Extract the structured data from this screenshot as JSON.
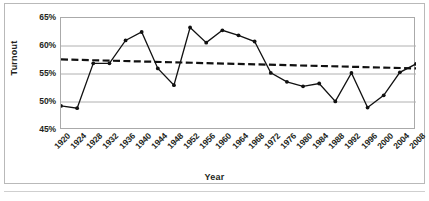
{
  "chart_data": {
    "type": "line",
    "title": "",
    "xlabel": "Year",
    "ylabel": "Turnout",
    "grid": true,
    "legend": "none",
    "x": [
      1920,
      1924,
      1928,
      1932,
      1936,
      1940,
      1944,
      1948,
      1952,
      1956,
      1960,
      1964,
      1968,
      1972,
      1976,
      1980,
      1984,
      1988,
      1992,
      1996,
      2000,
      2004,
      2008
    ],
    "xtick_labels": [
      "1920",
      "1924",
      "1928",
      "1932",
      "1936",
      "1940",
      "1944",
      "1948",
      "1952",
      "1956",
      "1960",
      "1964",
      "1968",
      "1972",
      "1976",
      "1980",
      "1984",
      "1988",
      "1992",
      "1996",
      "2000",
      "2004",
      "2008"
    ],
    "ytick_labels": [
      "65%",
      "60%",
      "55%",
      "50%",
      "45%"
    ],
    "ytick_values": [
      65,
      60,
      55,
      50,
      45
    ],
    "ylim": [
      45,
      65
    ],
    "yunit": "%",
    "series": [
      {
        "name": "Turnout",
        "style": "solid-line-with-markers",
        "color": "#111111",
        "values": [
          49.3,
          48.9,
          56.9,
          56.9,
          61.0,
          62.5,
          56.0,
          53.0,
          63.3,
          60.6,
          62.8,
          61.9,
          60.8,
          55.2,
          53.6,
          52.8,
          53.3,
          50.1,
          55.2,
          49.0,
          51.2,
          55.3,
          56.8
        ]
      },
      {
        "name": "Trendline",
        "style": "dashed-line",
        "color": "#111111",
        "endpoints": [
          57.6,
          56.0
        ]
      }
    ]
  },
  "axes": {
    "y_title": "Turnout",
    "x_title": "Year"
  }
}
